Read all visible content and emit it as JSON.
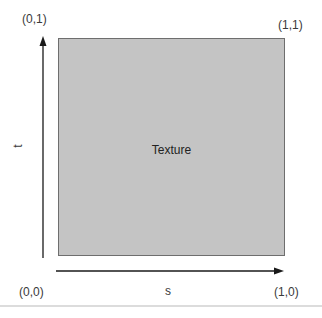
{
  "diagram": {
    "texture_label": "Texture",
    "corners": {
      "top_left": "(0,1)",
      "top_right": "(1,1)",
      "bottom_left": "(0,0)",
      "bottom_right": "(1,0)"
    },
    "axes": {
      "horizontal": "s",
      "vertical": "t"
    },
    "colors": {
      "texture_fill": "#c4c4c4",
      "texture_border": "#6e6e6e",
      "arrow": "#1a1a1a",
      "text": "#3a3a3a"
    }
  }
}
